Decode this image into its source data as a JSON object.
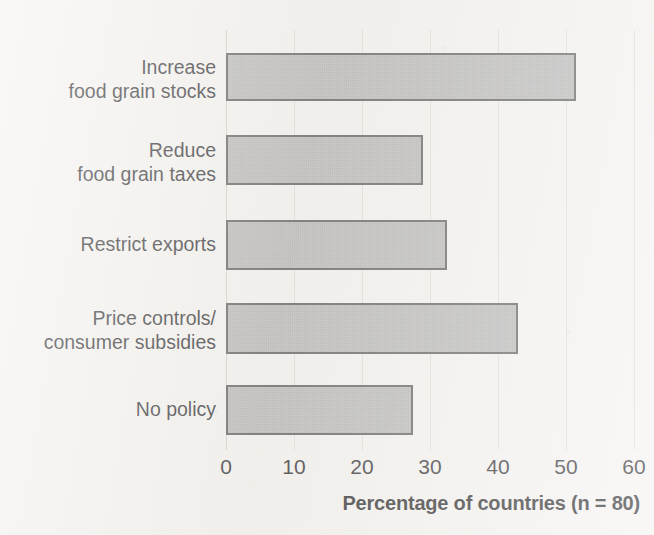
{
  "chart_data": {
    "type": "bar",
    "orientation": "horizontal",
    "title": "",
    "xlabel": "Percentage of countries (n = 80)",
    "ylabel": "",
    "categories": [
      "Increase\nfood grain stocks",
      "Reduce\nfood grain taxes",
      "Restrict exports",
      "Price controls/\nconsumer subsidies",
      "No policy"
    ],
    "category_lines": [
      [
        "Increase",
        "food grain stocks"
      ],
      [
        "Reduce",
        "food grain taxes"
      ],
      [
        "Restrict exports"
      ],
      [
        "Price controls/",
        "consumer subsidies"
      ],
      [
        "No policy"
      ]
    ],
    "values": [
      51.5,
      29,
      32.5,
      43,
      27.5
    ],
    "xlim": [
      0,
      60
    ],
    "xticks": [
      0,
      10,
      20,
      30,
      40,
      50,
      60
    ],
    "xtick_labels": [
      "0",
      "10",
      "20",
      "30",
      "40",
      "50",
      "60"
    ],
    "grid": "vertical",
    "legend": "none",
    "bar_fill_color": "#b2b2b2",
    "bar_edge_color": "#4a4a4a",
    "background_color": "#f3f1ee"
  },
  "axis": {
    "x_title": "Percentage of countries (n = 80)",
    "ticks": [
      "0",
      "10",
      "20",
      "30",
      "40",
      "50",
      "60"
    ]
  },
  "bars": [
    {
      "label_line1": "Increase",
      "label_line2": "food grain stocks",
      "value": 51.5
    },
    {
      "label_line1": "Reduce",
      "label_line2": "food grain taxes",
      "value": 29
    },
    {
      "label_line1": "Restrict exports",
      "label_line2": "",
      "value": 32.5
    },
    {
      "label_line1": "Price controls/",
      "label_line2": "consumer subsidies",
      "value": 43
    },
    {
      "label_line1": "No policy",
      "label_line2": "",
      "value": 27.5
    }
  ]
}
